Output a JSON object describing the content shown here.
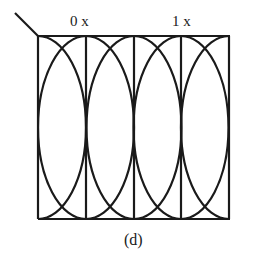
{
  "diagram": {
    "labels": {
      "zero_x": "0 x",
      "one_x": "1 x",
      "caption": "(d)"
    },
    "box": {
      "left": 38,
      "right": 229,
      "top": 36,
      "bottom": 219
    },
    "verticals_x": [
      38,
      86,
      134,
      181,
      229
    ],
    "ellipse": {
      "rx": 48,
      "ry": 91,
      "cy": 127.5
    },
    "stroke_color": "#1a1a1a"
  }
}
